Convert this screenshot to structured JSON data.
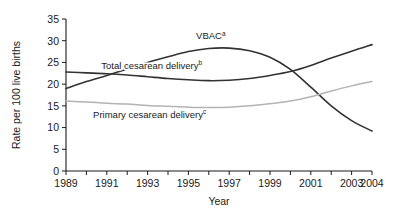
{
  "chart_data": {
    "type": "line",
    "title": "",
    "xlabel": "Year",
    "ylabel": "Rate per 100 live births",
    "xlim": [
      1989,
      2004
    ],
    "ylim": [
      0,
      35
    ],
    "grid": false,
    "legend_position": "inline-annotations",
    "x": [
      1989,
      1990,
      1991,
      1992,
      1993,
      1994,
      1995,
      1996,
      1997,
      1998,
      1999,
      2000,
      2001,
      2002,
      2003,
      2004
    ],
    "y_ticks": [
      0,
      5,
      10,
      15,
      20,
      25,
      30,
      35
    ],
    "x_ticks": [
      1989,
      1990,
      1991,
      1992,
      1993,
      1994,
      1995,
      1996,
      1997,
      1998,
      1999,
      2000,
      2001,
      2002,
      2003,
      2004
    ],
    "x_tick_labels": [
      "1989",
      "",
      "1991",
      "",
      "1993",
      "",
      "1995",
      "",
      "1997",
      "",
      "1999",
      "",
      "2001",
      "",
      "2003",
      "2004"
    ],
    "series": [
      {
        "name": "Total cesarean delivery",
        "superscript": "b",
        "label": "Total cesarean delivery",
        "color": "#333333",
        "width": 1.6,
        "label_x": 1993.2,
        "label_y": 23.6,
        "values": [
          22.8,
          22.6,
          22.4,
          22.1,
          21.7,
          21.3,
          21.0,
          20.8,
          20.9,
          21.3,
          22.0,
          22.9,
          24.3,
          26.0,
          27.6,
          29.1
        ]
      },
      {
        "name": "VBAC",
        "superscript": "a",
        "label": "VBAC",
        "color": "#333333",
        "width": 1.6,
        "label_x": 1996.1,
        "label_y": 30.3,
        "values": [
          19.0,
          20.6,
          22.0,
          23.5,
          25.0,
          26.3,
          27.5,
          28.2,
          28.3,
          27.7,
          26.2,
          23.4,
          19.3,
          15.0,
          11.6,
          9.2
        ]
      },
      {
        "name": "Primary cesarean delivery",
        "superscript": "c",
        "label": "Primary cesarean delivery",
        "color": "#b3b3b3",
        "width": 1.5,
        "label_x": 1993.1,
        "label_y": 12.3,
        "values": [
          16.1,
          15.9,
          15.6,
          15.4,
          15.1,
          14.9,
          14.7,
          14.6,
          14.7,
          15.0,
          15.5,
          16.1,
          17.1,
          18.4,
          19.6,
          20.6
        ]
      }
    ]
  }
}
